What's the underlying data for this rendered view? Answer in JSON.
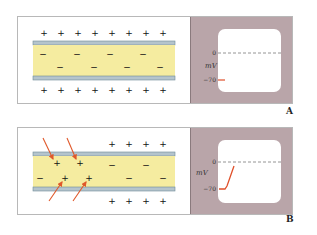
{
  "panels": [
    {
      "id": "A",
      "label": "A",
      "description": "Resting membrane: positive charges outside, negative inside",
      "outside_top": [
        "+",
        "+",
        "+",
        "+",
        "+",
        "+",
        "+",
        "+"
      ],
      "outside_bottom": [
        "+",
        "+",
        "+",
        "+",
        "+",
        "+",
        "+",
        "+"
      ],
      "inside_row1": [
        "−",
        "−",
        "−",
        "−"
      ],
      "inside_row2": [
        "−",
        "−",
        "−",
        "−"
      ],
      "scope": {
        "axis_label": "mV",
        "tick_zero": "0",
        "tick_rest": "−70",
        "trace": "flat at −70"
      }
    },
    {
      "id": "B",
      "label": "B",
      "description": "Depolarization: positive ions enter the axon",
      "outside_top": [
        "+",
        "+",
        "+",
        "+"
      ],
      "outside_bottom": [
        "+",
        "+",
        "+",
        "+"
      ],
      "inside_plus_row1": [
        "+",
        "+"
      ],
      "inside_plus_row2": [
        "+",
        "+"
      ],
      "inside_minus_row1": [
        "−",
        "−"
      ],
      "inside_minus_row2": [
        "−",
        "−",
        "−"
      ],
      "scope": {
        "axis_label": "mV",
        "tick_zero": "0",
        "tick_rest": "−70",
        "trace": "rising from −70 toward 0"
      }
    }
  ],
  "colors": {
    "axoplasm": "#f5eca0",
    "membrane": "#b4c4cc",
    "membrane_line": "#6f8a96",
    "scope_bg": "#b9a5a9",
    "trace": "#e0502a",
    "arrow": "#e0582a"
  }
}
